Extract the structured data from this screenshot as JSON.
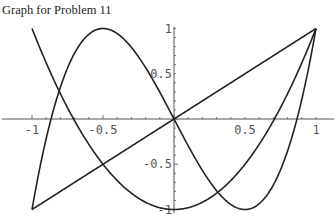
{
  "title": "Graph for Problem 11",
  "chart_data": {
    "type": "line",
    "title": "Graph for Problem 11",
    "xlabel": "",
    "ylabel": "",
    "xlim": [
      -1,
      1
    ],
    "ylim": [
      -1,
      1
    ],
    "grid": false,
    "legend": null,
    "x_ticks": [
      "-1",
      "-0.5",
      "0.5",
      "1"
    ],
    "y_ticks": [
      "1",
      "0.5",
      "-0.5",
      "-1"
    ],
    "series": [
      {
        "name": "y = x",
        "expr": "x",
        "x": [
          -1,
          1
        ],
        "values": [
          -1,
          1
        ]
      },
      {
        "name": "y = 2x^2 - 1",
        "expr": "2*x*x-1",
        "x": [
          -1,
          -0.5,
          0,
          0.5,
          1
        ],
        "values": [
          1,
          -0.5,
          -1,
          -0.5,
          1
        ]
      },
      {
        "name": "y = 4x^3 - 3x",
        "expr": "4*x*x*x-3*x",
        "x": [
          -1,
          -0.5,
          0,
          0.5,
          1
        ],
        "values": [
          -1,
          1,
          0,
          -1,
          1
        ]
      }
    ],
    "annotations": []
  },
  "colors": {
    "curve": "#222222",
    "axis": "#555555"
  }
}
